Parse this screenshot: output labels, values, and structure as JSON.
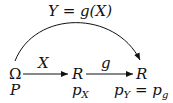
{
  "diagram": {
    "title_label": "Y = g(X)",
    "nodes": [
      {
        "id": "omega",
        "symbol": "Ω",
        "measure": "P"
      },
      {
        "id": "R1",
        "symbol": "R",
        "measure_base": "p",
        "measure_sub": "X"
      },
      {
        "id": "R2",
        "symbol": "R",
        "measure_base": "p",
        "measure_sub": "Y",
        "measure_eq": "=",
        "measure2_base": "p",
        "measure2_sub": "g"
      }
    ],
    "edges": [
      {
        "from": "omega",
        "to": "R1",
        "label": "X"
      },
      {
        "from": "R1",
        "to": "R2",
        "label": "g"
      },
      {
        "from": "omega",
        "to": "R2",
        "label": "Y = g(X)",
        "style": "curved"
      }
    ],
    "colors": {
      "ink": "#111111",
      "background": "#ffffff"
    }
  }
}
